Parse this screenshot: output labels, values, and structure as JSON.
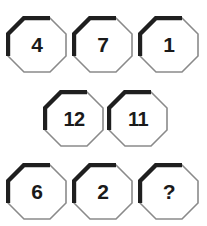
{
  "figure": {
    "type": "number-puzzle",
    "shape": "octagon",
    "background_color": "#ffffff",
    "shape_fill_color": "#ffffff",
    "shape_highlight_stroke_color": "#1f1f1f",
    "shape_light_stroke_color": "#8a8a8a",
    "label_color": "#1a1a1a",
    "rows": [
      {
        "name": "row-top",
        "cells": [
          {
            "label": "4",
            "name": "octagon-4"
          },
          {
            "label": "7",
            "name": "octagon-7"
          },
          {
            "label": "1",
            "name": "octagon-1"
          }
        ]
      },
      {
        "name": "row-middle",
        "cells": [
          {
            "label": "12",
            "name": "octagon-12"
          },
          {
            "label": "11",
            "name": "octagon-11"
          }
        ]
      },
      {
        "name": "row-bottom",
        "cells": [
          {
            "label": "6",
            "name": "octagon-6"
          },
          {
            "label": "2",
            "name": "octagon-2"
          },
          {
            "label": "?",
            "name": "octagon-unknown"
          }
        ]
      }
    ]
  }
}
